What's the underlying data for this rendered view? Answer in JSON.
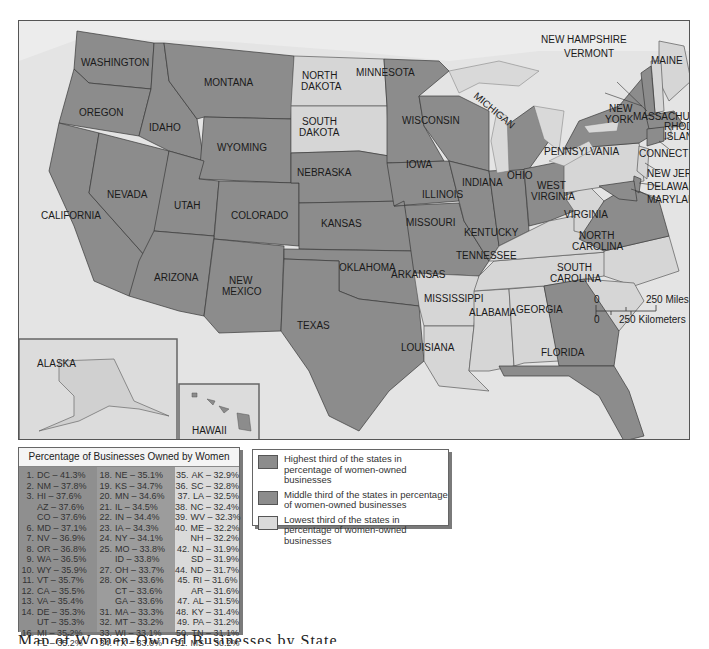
{
  "map": {
    "labels": {
      "washington": "WASHINGTON",
      "oregon": "OREGON",
      "california": "CALIFORNIA",
      "idaho": "IDAHO",
      "montana": "MONTANA",
      "wyoming": "WYOMING",
      "nevada": "NEVADA",
      "utah": "UTAH",
      "colorado": "COLORADO",
      "arizona": "ARIZONA",
      "new_mexico_1": "NEW",
      "new_mexico_2": "MEXICO",
      "north_dakota_1": "NORTH",
      "north_dakota_2": "DAKOTA",
      "south_dakota_1": "SOUTH",
      "south_dakota_2": "DAKOTA",
      "nebraska": "NEBRASKA",
      "kansas": "KANSAS",
      "oklahoma": "OKLAHOMA",
      "texas": "TEXAS",
      "minnesota": "MINNESOTA",
      "iowa": "IOWA",
      "missouri": "MISSOURI",
      "arkansas": "ARKANSAS",
      "louisiana": "LOUISIANA",
      "wisconsin": "WISCONSIN",
      "illinois": "ILLINOIS",
      "michigan": "MICHIGAN",
      "indiana": "INDIANA",
      "ohio": "OHIO",
      "kentucky": "KENTUCKY",
      "tennessee": "TENNESSEE",
      "mississippi": "MISSISSIPPI",
      "alabama": "ALABAMA",
      "georgia": "GEORGIA",
      "florida": "FLORIDA",
      "south_carolina_1": "SOUTH",
      "south_carolina_2": "CAROLINA",
      "north_carolina_1": "NORTH",
      "north_carolina_2": "CAROLINA",
      "virginia": "VIRGINIA",
      "west_virginia_1": "WEST",
      "west_virginia_2": "VIRGINIA",
      "pennsylvania": "PENNSYLVANIA",
      "new_york_1": "NEW",
      "new_york_2": "YORK",
      "new_jersey": "NEW JERSEY",
      "delaware": "DELAWARE",
      "maryland": "MARYLAND",
      "connecticut": "CONNECTICUT",
      "rhode_island_1": "RHODE",
      "rhode_island_2": "ISLAND",
      "massachusetts": "MASSACHUSETTS",
      "vermont": "VERMONT",
      "new_hampshire": "NEW HAMPSHIRE",
      "maine": "MAINE",
      "alaska": "ALASKA",
      "hawaii": "HAWAII"
    },
    "scale": {
      "zero_top": "0",
      "zero_bottom": "0",
      "miles": "250 Miles",
      "kilometers": "250 Kilometers"
    }
  },
  "table": {
    "title": "Percentage of Businesses Owned by Women",
    "columns": [
      [
        {
          "rank": "1.",
          "entry": "DC – 41.3%"
        },
        {
          "rank": "2.",
          "entry": "NM – 37.8%"
        },
        {
          "rank": "3.",
          "entry": "HI – 37.6%"
        },
        {
          "rank": "",
          "entry": "AZ – 37.6%"
        },
        {
          "rank": "",
          "entry": "CO – 37.6%"
        },
        {
          "rank": "6.",
          "entry": "MD – 37.1%"
        },
        {
          "rank": "7.",
          "entry": "NV – 36.9%"
        },
        {
          "rank": "8.",
          "entry": "OR – 36.8%"
        },
        {
          "rank": "9.",
          "entry": "WA – 36.5%"
        },
        {
          "rank": "10.",
          "entry": "WY – 35.9%"
        },
        {
          "rank": "11.",
          "entry": "VT – 35.7%"
        },
        {
          "rank": "12.",
          "entry": "CA – 35.5%"
        },
        {
          "rank": "13.",
          "entry": "VA – 35.4%"
        },
        {
          "rank": "14.",
          "entry": "DE – 35.3%"
        },
        {
          "rank": "",
          "entry": "UT – 35.3%"
        },
        {
          "rank": "16.",
          "entry": "MI – 35.2%"
        },
        {
          "rank": "",
          "entry": "FL – 35.2%"
        }
      ],
      [
        {
          "rank": "18.",
          "entry": "NE – 35.1%"
        },
        {
          "rank": "19.",
          "entry": "KS – 34.7%"
        },
        {
          "rank": "20.",
          "entry": "MN – 34.6%"
        },
        {
          "rank": "21.",
          "entry": "IL – 34.5%"
        },
        {
          "rank": "22.",
          "entry": "IN – 34.4%"
        },
        {
          "rank": "23.",
          "entry": "IA – 34.3%"
        },
        {
          "rank": "24.",
          "entry": "NY – 34.1%"
        },
        {
          "rank": "25.",
          "entry": "MO – 33.8%"
        },
        {
          "rank": "",
          "entry": "ID – 33.8%"
        },
        {
          "rank": "27.",
          "entry": "OH – 33.7%"
        },
        {
          "rank": "28.",
          "entry": "OK – 33.6%"
        },
        {
          "rank": "",
          "entry": "CT – 33.6%"
        },
        {
          "rank": "",
          "entry": "GA – 33.6%"
        },
        {
          "rank": "31.",
          "entry": "MA – 33.3%"
        },
        {
          "rank": "32.",
          "entry": "MT – 33.2%"
        },
        {
          "rank": "33.",
          "entry": "WI – 33.1%"
        },
        {
          "rank": "34.",
          "entry": "TX – 33.0%"
        }
      ],
      [
        {
          "rank": "35.",
          "entry": "AK – 32.9%"
        },
        {
          "rank": "36.",
          "entry": "SC – 32.8%"
        },
        {
          "rank": "37.",
          "entry": "LA – 32.5%"
        },
        {
          "rank": "38.",
          "entry": "NC – 32.4%"
        },
        {
          "rank": "39.",
          "entry": "WV – 32.3%"
        },
        {
          "rank": "40.",
          "entry": "ME – 32.2%"
        },
        {
          "rank": "",
          "entry": "NH – 32.2%"
        },
        {
          "rank": "42.",
          "entry": "NJ – 31.9%"
        },
        {
          "rank": "",
          "entry": "SD – 31.9%"
        },
        {
          "rank": "44.",
          "entry": "ND – 31.7%"
        },
        {
          "rank": "45.",
          "entry": "RI – 31.6%"
        },
        {
          "rank": "",
          "entry": "AR – 31.6%"
        },
        {
          "rank": "47.",
          "entry": "AL – 31.5%"
        },
        {
          "rank": "48.",
          "entry": "KY – 31.4%"
        },
        {
          "rank": "49.",
          "entry": "PA – 31.2%"
        },
        {
          "rank": "50.",
          "entry": "TN – 31.1%"
        },
        {
          "rank": "51.",
          "entry": "MS – 30.2%"
        }
      ]
    ]
  },
  "legend": {
    "items": [
      {
        "text": "Highest third of the states in percentage of women-owned businesses",
        "color": "#8c8c8c"
      },
      {
        "text": "Middle third of the states in percentage of women-owned businesses",
        "color": "#8c8c8c"
      },
      {
        "text": "Lowest third of the states in percentage of women-owned businesses",
        "color": "#dadada"
      }
    ]
  },
  "caption": "Map of Women-Owned Businesses by State",
  "colors": {
    "highest": "#8c8c8c",
    "middle": "#8c8c8c",
    "lowest": "#d6d6d6",
    "water": "#e4e4e4"
  }
}
